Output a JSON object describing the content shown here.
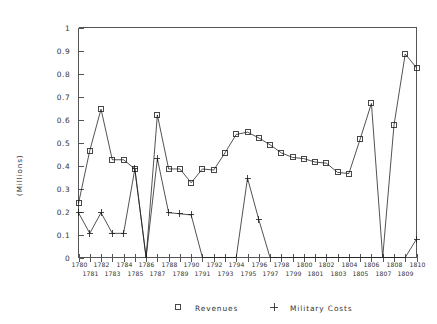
{
  "chart_data": {
    "type": "line",
    "title": "",
    "xlabel": "",
    "ylabel": "(Millions)",
    "xlim": [
      1780,
      1810
    ],
    "ylim": [
      0,
      1
    ],
    "yticks": [
      "0",
      "0.1",
      "0.2",
      "0.3",
      "0.4",
      "0.5",
      "0.6",
      "0.7",
      "0.8",
      "0.9",
      "1"
    ],
    "ytick_values": [
      0,
      0.1,
      0.2,
      0.3,
      0.4,
      0.5,
      0.6,
      0.7,
      0.8,
      0.9,
      1
    ],
    "grid": false,
    "legend_position": "bottom",
    "x": [
      1780,
      1781,
      1782,
      1783,
      1784,
      1785,
      1786,
      1787,
      1788,
      1789,
      1790,
      1791,
      1792,
      1793,
      1794,
      1795,
      1796,
      1797,
      1798,
      1799,
      1800,
      1801,
      1802,
      1803,
      1804,
      1805,
      1806,
      1807,
      1808,
      1809,
      1810
    ],
    "xtick_labels": [
      "1780",
      "1781",
      "1782",
      "1783",
      "1784",
      "1785",
      "1786",
      "1787",
      "1788",
      "1789",
      "1790",
      "1791",
      "1792",
      "1793",
      "1794",
      "1795",
      "1796",
      "1797",
      "1798",
      "1799",
      "1800",
      "1801",
      "1802",
      "1803",
      "1804",
      "1805",
      "1806",
      "1807",
      "1808",
      "1809",
      "1810"
    ],
    "series": [
      {
        "name": "Revenues",
        "marker": "square",
        "values": [
          0.235,
          0.465,
          0.645,
          0.425,
          0.425,
          0.385,
          0.0,
          0.62,
          0.385,
          0.385,
          0.325,
          0.385,
          0.38,
          0.455,
          0.535,
          0.545,
          0.52,
          0.49,
          0.455,
          0.435,
          0.43,
          0.415,
          0.41,
          0.37,
          0.365,
          0.515,
          0.67,
          0.0,
          0.575,
          0.885,
          0.825
        ]
      },
      {
        "name": "Military Costs",
        "marker": "plus",
        "values": [
          0.195,
          0.105,
          0.195,
          0.105,
          0.105,
          0.385,
          0.0,
          0.43,
          0.195,
          0.19,
          0.185,
          0.0,
          0.0,
          0.0,
          0.0,
          0.345,
          0.165,
          0.0,
          0.0,
          0.0,
          0.0,
          0.0,
          0.0,
          0.0,
          0.0,
          0.0,
          0.0,
          0.0,
          0.0,
          0.0,
          0.08
        ]
      }
    ],
    "legend": [
      {
        "label": "Revenues",
        "marker": "square"
      },
      {
        "label": "Military Costs",
        "marker": "plus"
      }
    ]
  }
}
